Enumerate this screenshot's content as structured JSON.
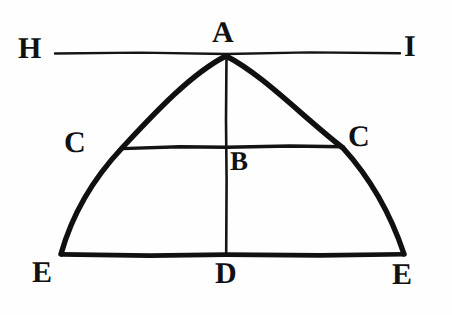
{
  "figure": {
    "caption": "",
    "background_color": "#fefefe",
    "ink_color": "#111111",
    "width": 452,
    "height": 315,
    "labels": {
      "apex": "A",
      "tangent_left": "H",
      "tangent_right": "I",
      "chord_left": "C",
      "chord_right": "C",
      "axis_mid": "B",
      "base_left": "E",
      "base_right": "E",
      "base_mid": "D"
    },
    "points": [
      {
        "name": "A",
        "label": "A",
        "x": 226,
        "y": 55,
        "role": "apex-of-curve"
      },
      {
        "name": "H",
        "label": "H",
        "x": 55,
        "y": 53,
        "role": "tangent-line-left-end"
      },
      {
        "name": "I",
        "label": "I",
        "x": 400,
        "y": 53,
        "role": "tangent-line-right-end"
      },
      {
        "name": "C-left",
        "label": "C",
        "x": 122,
        "y": 147,
        "role": "chord-left-end"
      },
      {
        "name": "C-right",
        "label": "C",
        "x": 343,
        "y": 146,
        "role": "chord-right-end"
      },
      {
        "name": "B",
        "label": "B",
        "x": 226,
        "y": 147,
        "role": "axis-chord-intersection"
      },
      {
        "name": "E-left",
        "label": "E",
        "x": 61,
        "y": 254,
        "role": "base-left-end"
      },
      {
        "name": "E-right",
        "label": "E",
        "x": 404,
        "y": 254,
        "role": "base-right-end"
      },
      {
        "name": "D",
        "label": "D",
        "x": 226,
        "y": 254,
        "role": "axis-base-intersection"
      }
    ],
    "segments": [
      {
        "name": "tangent-line-HI",
        "from": "H",
        "to": "I",
        "orientation": "horizontal",
        "stroke_width": 2.2
      },
      {
        "name": "chord-line-CC",
        "from": "C-left",
        "to": "C-right",
        "orientation": "horizontal",
        "stroke_width": 3.0
      },
      {
        "name": "base-line-EE",
        "from": "E-left",
        "to": "E-right",
        "orientation": "horizontal",
        "stroke_width": 4.0
      },
      {
        "name": "axis-line-AD",
        "from": "A",
        "to": "D",
        "orientation": "vertical",
        "stroke_width": 2.4
      }
    ],
    "curve": {
      "name": "parabolic-arc-EAE",
      "type": "parabola",
      "from": "E-left",
      "apex": "A",
      "to": "E-right",
      "stroke_width": 5.2
    }
  }
}
